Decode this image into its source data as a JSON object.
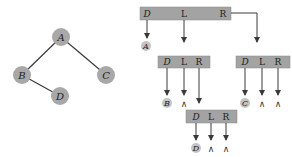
{
  "colors": {
    "node_fill": "#a8a8a8",
    "box_fill": "#a3a3a3",
    "line": "#3a3a3a",
    "text": "#222222",
    "small_node_fill": "#c4c4c4"
  },
  "tree": {
    "nodes": [
      {
        "id": "A",
        "label": "A",
        "x": 61,
        "y": 37
      },
      {
        "id": "B",
        "label": "B",
        "x": 22,
        "y": 75
      },
      {
        "id": "C",
        "label": "C",
        "x": 106,
        "y": 75
      },
      {
        "id": "D",
        "label": "D",
        "x": 60,
        "y": 96
      }
    ],
    "edges": [
      [
        "A",
        "B"
      ],
      [
        "A",
        "C"
      ],
      [
        "B",
        "D"
      ]
    ]
  },
  "linked": {
    "field_labels": {
      "data": "D",
      "left": "L",
      "right": "R"
    },
    "top_box": {
      "data_value": "A"
    },
    "left_box": {
      "data_value": "B",
      "left_null": "∧"
    },
    "right_box": {
      "data_value": "C",
      "left_null": "∧",
      "right_null": "∧"
    },
    "bottom_box": {
      "data_value": "D",
      "left_null": "∧",
      "right_null": "∧"
    }
  }
}
